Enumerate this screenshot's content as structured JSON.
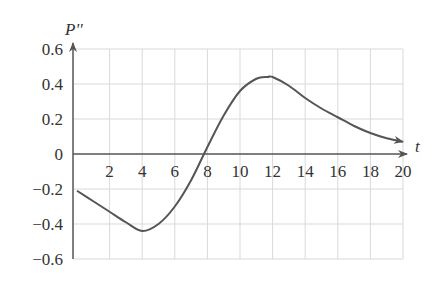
{
  "chart_data": {
    "type": "line",
    "title": "",
    "xlabel": "t",
    "ylabel": "P''",
    "xlim": [
      0,
      20
    ],
    "ylim": [
      -0.6,
      0.6
    ],
    "grid": true,
    "legend": null,
    "x_ticks": [
      2,
      4,
      6,
      8,
      10,
      12,
      14,
      16,
      18,
      20
    ],
    "x_tick_labels": [
      "2",
      "4",
      "6",
      "8",
      "10",
      "12",
      "14",
      "16",
      "18",
      "20"
    ],
    "y_ticks": [
      0.6,
      0.4,
      0.2,
      0,
      -0.2,
      -0.4,
      -0.6
    ],
    "y_tick_labels": [
      "0.6",
      "0.4",
      "0.2",
      "0",
      "−0.2",
      "−0.4",
      "−0.6"
    ],
    "series": [
      {
        "name": "P''(t)",
        "x": [
          0,
          1,
          2,
          3,
          4,
          5,
          6,
          7,
          8,
          9,
          10,
          11,
          11.7,
          12,
          13,
          14,
          15,
          16,
          17,
          18,
          19,
          20
        ],
        "values": [
          -0.21,
          -0.27,
          -0.33,
          -0.39,
          -0.44,
          -0.4,
          -0.3,
          -0.15,
          0.04,
          0.22,
          0.36,
          0.43,
          0.44,
          0.44,
          0.39,
          0.32,
          0.26,
          0.21,
          0.16,
          0.12,
          0.09,
          0.07
        ],
        "color": "#555555",
        "end_arrow": true
      }
    ]
  },
  "colors": {
    "grid": "#d9d9d9",
    "axis": "#555555",
    "curve": "#555555",
    "text": "#333333"
  }
}
